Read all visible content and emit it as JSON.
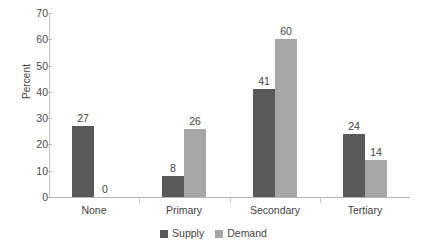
{
  "chart_data": {
    "type": "bar",
    "title": "",
    "subtitle": "",
    "xlabel": "",
    "ylabel": "Percent",
    "categories": [
      "None",
      "Primary",
      "Secondary",
      "Tertiary"
    ],
    "series": [
      {
        "name": "Supply",
        "values": [
          27,
          8,
          41,
          24
        ],
        "color": "#595959"
      },
      {
        "name": "Demand",
        "values": [
          0,
          26,
          60,
          14
        ],
        "color": "#a6a6a6"
      }
    ],
    "ylim": [
      0,
      70
    ],
    "ytick_values": [
      0,
      10,
      20,
      30,
      40,
      50,
      60,
      70
    ],
    "ytick_labels": [
      "0",
      "10",
      "20",
      "30",
      "40",
      "50",
      "60",
      "70"
    ],
    "grid": false,
    "legend_position": "bottom-center",
    "data_labels": true,
    "data_label_values": {
      "Supply": [
        "27",
        "8",
        "41",
        "24"
      ],
      "Demand": [
        "0",
        "26",
        "60",
        "14"
      ]
    }
  },
  "legend": {
    "items": [
      {
        "label": "Supply",
        "color": "#595959"
      },
      {
        "label": "Demand",
        "color": "#a6a6a6"
      }
    ]
  },
  "axes": {
    "y_title": "Percent",
    "y_ticks": [
      "70",
      "60",
      "50",
      "40",
      "30",
      "20",
      "10",
      "0"
    ],
    "x_categories": [
      "None",
      "Primary",
      "Secondary",
      "Tertiary"
    ]
  }
}
